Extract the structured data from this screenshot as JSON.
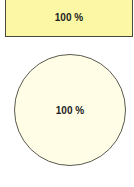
{
  "shapes": {
    "rectangle": {
      "label": "100 %",
      "fill": "#fbf7a4"
    },
    "circle": {
      "label": "100 %",
      "fill": "#fffde6"
    }
  }
}
